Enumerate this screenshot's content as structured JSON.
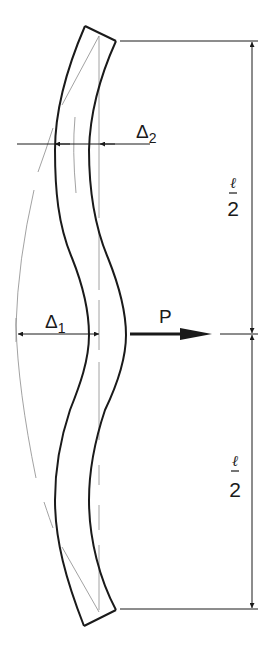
{
  "diagram": {
    "type": "engineering-drawing",
    "colors": {
      "outline": "#1a1a1a",
      "construction": "#8a8a8a",
      "background": "#ffffff"
    },
    "labels": {
      "delta2": {
        "symbol": "Δ",
        "subscript": "2"
      },
      "delta1": {
        "symbol": "Δ",
        "subscript": "1"
      },
      "load": "P",
      "upper_half": {
        "numerator": "ℓ",
        "denominator": "2"
      },
      "lower_half": {
        "numerator": "ℓ",
        "denominator": "2"
      }
    },
    "dimensions": {
      "total_span": "ℓ",
      "segments": [
        "ℓ/2",
        "ℓ/2"
      ]
    }
  }
}
